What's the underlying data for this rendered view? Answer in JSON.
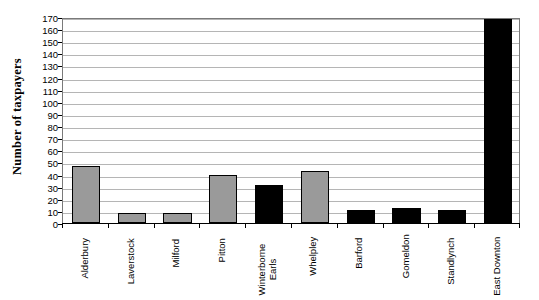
{
  "chart_data": {
    "type": "bar",
    "title": "",
    "subtitle": "",
    "xlabel": "",
    "ylabel": "Number of taxpayers",
    "ylim": [
      0,
      170
    ],
    "ytick_step": 10,
    "yticks": [
      0,
      10,
      20,
      30,
      40,
      50,
      60,
      70,
      80,
      90,
      100,
      110,
      120,
      130,
      140,
      150,
      160,
      170
    ],
    "ytick_labels": [
      "0",
      "10",
      "20",
      "30",
      "40",
      "50",
      "60",
      "70",
      "80",
      "90",
      "100",
      "110",
      "120",
      "130",
      "140",
      "150",
      "160",
      "170"
    ],
    "grid": true,
    "grid_axis": "y",
    "legend": false,
    "legend_position": "none",
    "categories": [
      "Alderbury",
      "Laverstock",
      "Milford",
      "Pitton",
      "Winterborne Earls",
      "Whelpley",
      "Barford",
      "Gomeldon",
      "Standlynch",
      "East Downton"
    ],
    "category_label_lines": [
      [
        "Alderbury"
      ],
      [
        "Laverstock"
      ],
      [
        "Milford"
      ],
      [
        "Pitton"
      ],
      [
        "Winterborne",
        "Earls"
      ],
      [
        "Whelpley"
      ],
      [
        "Barford"
      ],
      [
        "Gomeldon"
      ],
      [
        "Standlynch"
      ],
      [
        "East Downton"
      ]
    ],
    "values": [
      47,
      8,
      8.5,
      39.5,
      31,
      43,
      11,
      12,
      10.5,
      172
    ],
    "bar_colors": [
      "#9a9a9a",
      "#9a9a9a",
      "#9a9a9a",
      "#9a9a9a",
      "#000000",
      "#9a9a9a",
      "#000000",
      "#000000",
      "#000000",
      "#000000"
    ],
    "bar_edge_color": "#000000"
  },
  "colors": {
    "gray_bar": "#9a9a9a",
    "black_bar": "#000000",
    "gridline": "#b5b5b5",
    "axis": "#000000",
    "plot_border": "#7a7a7a",
    "background": "#ffffff"
  }
}
